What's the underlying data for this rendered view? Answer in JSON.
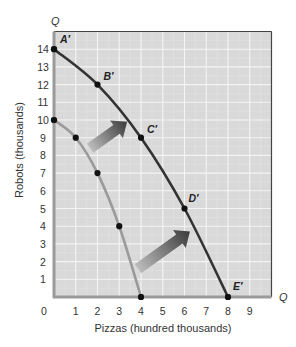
{
  "chart_data": {
    "type": "line",
    "title": "",
    "xlabel": "Pizzas (hundred thousands)",
    "ylabel": "Robots (thousands)",
    "x_axis_end_label": "Q",
    "y_axis_end_label": "Q",
    "xlim": [
      0,
      10
    ],
    "ylim": [
      0,
      15
    ],
    "x_ticks": [
      "0",
      "1",
      "2",
      "3",
      "4",
      "5",
      "6",
      "7",
      "8",
      "9"
    ],
    "y_ticks": [
      "1",
      "2",
      "3",
      "4",
      "5",
      "6",
      "7",
      "8",
      "9",
      "10",
      "11",
      "12",
      "13",
      "14"
    ],
    "grid": true,
    "series": [
      {
        "name": "Original PPF",
        "color": "#9a9a9a",
        "points": [
          {
            "x": 0,
            "y": 10,
            "label": ""
          },
          {
            "x": 1,
            "y": 9,
            "label": ""
          },
          {
            "x": 2,
            "y": 7,
            "label": ""
          },
          {
            "x": 3,
            "y": 4,
            "label": ""
          },
          {
            "x": 4,
            "y": 0,
            "label": ""
          }
        ]
      },
      {
        "name": "Shifted PPF",
        "color": "#333333",
        "points": [
          {
            "x": 0,
            "y": 14,
            "label": "A′"
          },
          {
            "x": 2,
            "y": 12,
            "label": "B′"
          },
          {
            "x": 4,
            "y": 9,
            "label": "C′"
          },
          {
            "x": 6,
            "y": 5,
            "label": "D′"
          },
          {
            "x": 8,
            "y": 0,
            "label": "E′"
          }
        ]
      }
    ],
    "annotations": [
      {
        "type": "arrow",
        "from": [
          1.66,
          8.4
        ],
        "to": [
          3.36,
          9.9
        ]
      },
      {
        "type": "arrow",
        "from": [
          3.86,
          1.6
        ],
        "to": [
          6.25,
          3.7
        ]
      }
    ]
  },
  "colors": {
    "plot_background": "#d9d9d9",
    "grid_major": "#f4f4f4",
    "grid_minor": "#e3e3e3",
    "axis": "#9a9a9a",
    "border": "#444444",
    "dot": "#111111",
    "arrow_start": "#bdbdbd",
    "arrow_end": "#3a3a3a"
  }
}
